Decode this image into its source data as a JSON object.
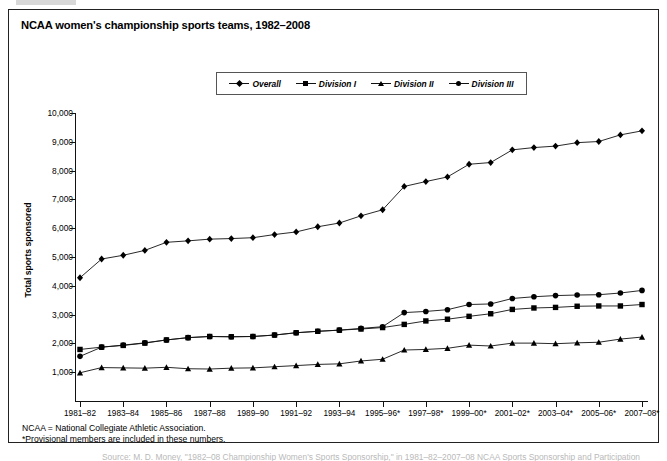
{
  "figure": {
    "title": "NCAA women's championship sports teams, 1982–2008",
    "notes": [
      "NCAA = National Collegiate Athletic Association.",
      "*Provisional members are included in these numbers."
    ],
    "caption": "Source: M. D. Money, \"1982–08 Championship Women's Sports Sponsorship,\" in 1981–82–2007–08 NCAA Sports Sponsorship and Participation"
  },
  "legend": {
    "position": "top-center",
    "items": [
      {
        "label": "Overall",
        "marker": "diamond-marker-icon"
      },
      {
        "label": "Division I",
        "marker": "square-marker-icon"
      },
      {
        "label": "Division II",
        "marker": "triangle-marker-icon"
      },
      {
        "label": "Division III",
        "marker": "circle-marker-icon"
      }
    ]
  },
  "chart_data": {
    "type": "line",
    "title": "NCAA women's championship sports teams, 1982–2008",
    "xlabel": "",
    "ylabel": "Total sports sponsored",
    "ylim": [
      0,
      10000
    ],
    "ytick_values": [
      1000,
      2000,
      3000,
      4000,
      5000,
      6000,
      7000,
      8000,
      9000,
      10000
    ],
    "ytick_labels": [
      "1,000",
      "2,000",
      "3,000",
      "4,000",
      "5,000",
      "6,000",
      "7,000",
      "8,000",
      "9,000",
      "10,000"
    ],
    "grid": false,
    "x": [
      "1981–82",
      "1982–83",
      "1983–84",
      "1984–85",
      "1985–86",
      "1986–87",
      "1987–88",
      "1988–89",
      "1989–90",
      "1990–91",
      "1991–92",
      "1992–93",
      "1993–94",
      "1994–95",
      "1995–96*",
      "1996–97*",
      "1997–98*",
      "1998–99*",
      "1999–00*",
      "2000–01*",
      "2001–02*",
      "2002–03*",
      "2003–04*",
      "2004–05*",
      "2005–06*",
      "2006–07*",
      "2007–08*"
    ],
    "xtick_labels_shown": [
      "1981–82",
      "1983–84",
      "1985–86",
      "1987–88",
      "1989–90",
      "1991–92",
      "1993–94",
      "1995–96*",
      "1997–98*",
      "1999–00*",
      "2001–02*",
      "2003–04*",
      "2005–06*",
      "2007–08*"
    ],
    "series": [
      {
        "name": "Overall",
        "marker": "diamond",
        "values": [
          4280,
          4930,
          5060,
          5230,
          5510,
          5560,
          5620,
          5640,
          5670,
          5780,
          5870,
          6050,
          6180,
          6430,
          6640,
          7450,
          7620,
          7780,
          8220,
          8280,
          8720,
          8800,
          8850,
          8970,
          9010,
          9240,
          9380
        ]
      },
      {
        "name": "Division I",
        "marker": "square",
        "values": [
          1790,
          1870,
          1930,
          2010,
          2120,
          2200,
          2240,
          2230,
          2240,
          2290,
          2370,
          2420,
          2460,
          2500,
          2550,
          2660,
          2780,
          2840,
          2940,
          3030,
          3180,
          3230,
          3250,
          3290,
          3300,
          3300,
          3350
        ]
      },
      {
        "name": "Division II",
        "marker": "triangle",
        "values": [
          980,
          1160,
          1150,
          1140,
          1170,
          1120,
          1110,
          1140,
          1150,
          1190,
          1230,
          1270,
          1290,
          1390,
          1450,
          1770,
          1790,
          1830,
          1940,
          1910,
          2010,
          2010,
          1990,
          2020,
          2040,
          2150,
          2220
        ]
      },
      {
        "name": "Division III",
        "marker": "circle",
        "values": [
          1550,
          1870,
          1940,
          2020,
          2120,
          2200,
          2240,
          2230,
          2240,
          2290,
          2370,
          2420,
          2460,
          2520,
          2580,
          3070,
          3110,
          3170,
          3350,
          3370,
          3560,
          3620,
          3660,
          3680,
          3690,
          3750,
          3840
        ]
      }
    ]
  }
}
